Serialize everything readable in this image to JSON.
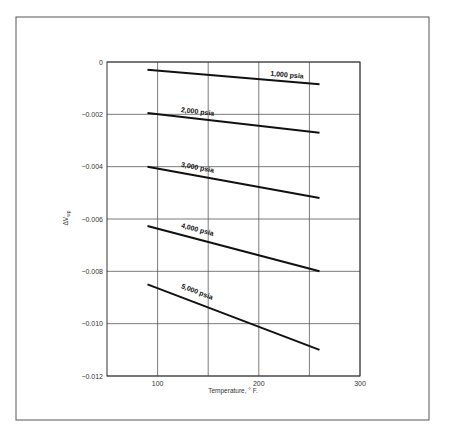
{
  "chart_data": {
    "type": "line",
    "title": "",
    "xlabel": "Temperature, ° F.",
    "ylabel": "ΔVwp",
    "ylabel_main": "ΔV",
    "ylabel_sub": "wp",
    "xlim": [
      50,
      300
    ],
    "ylim": [
      -0.012,
      0
    ],
    "grid": true,
    "x_ticks": [
      100,
      200,
      300
    ],
    "x_tick_labels": [
      "100",
      "200",
      "300"
    ],
    "x_gridlines": [
      100,
      150,
      200,
      250,
      300
    ],
    "y_ticks": [
      0,
      -0.002,
      -0.004,
      -0.006,
      -0.008,
      -0.01,
      -0.012
    ],
    "y_tick_labels": [
      "0",
      "−0.002",
      "−0.004",
      "−0.006",
      "−0.008",
      "−0.010",
      "−0.012"
    ],
    "series": [
      {
        "name": "1,000 psia",
        "x": [
          90,
          260
        ],
        "values": [
          -0.0003,
          -0.00085
        ]
      },
      {
        "name": "2,000 psia",
        "x": [
          90,
          260
        ],
        "values": [
          -0.00195,
          -0.0027
        ]
      },
      {
        "name": "3,000 psia",
        "x": [
          90,
          260
        ],
        "values": [
          -0.004,
          -0.0052
        ]
      },
      {
        "name": "4,000 psia",
        "x": [
          90,
          260
        ],
        "values": [
          -0.00627,
          -0.008
        ]
      },
      {
        "name": "5,000 psia",
        "x": [
          90,
          260
        ],
        "values": [
          -0.0085,
          -0.011
        ]
      }
    ],
    "legend": "inline labels on lines"
  },
  "caption": "Fig. 10. Pore-volume correction factor for water (partially cut off)"
}
